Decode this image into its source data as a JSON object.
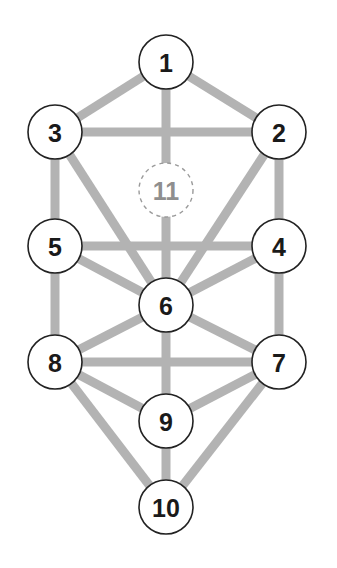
{
  "diagram": {
    "title": "",
    "edge_color": "#b3b3b3",
    "node_stroke": "#222222",
    "hidden_node_stroke": "#9a9a9a",
    "nodes": [
      {
        "id": "1",
        "label": "1",
        "x": 166,
        "y": 62,
        "r": 27,
        "style": "solid"
      },
      {
        "id": "2",
        "label": "2",
        "x": 279,
        "y": 132,
        "r": 27,
        "style": "solid"
      },
      {
        "id": "3",
        "label": "3",
        "x": 55,
        "y": 132,
        "r": 27,
        "style": "solid"
      },
      {
        "id": "11",
        "label": "11",
        "x": 166,
        "y": 190,
        "r": 27,
        "style": "dashed"
      },
      {
        "id": "4",
        "label": "4",
        "x": 279,
        "y": 246,
        "r": 27,
        "style": "solid"
      },
      {
        "id": "5",
        "label": "5",
        "x": 55,
        "y": 246,
        "r": 27,
        "style": "solid"
      },
      {
        "id": "6",
        "label": "6",
        "x": 166,
        "y": 305,
        "r": 27,
        "style": "solid"
      },
      {
        "id": "7",
        "label": "7",
        "x": 279,
        "y": 362,
        "r": 27,
        "style": "solid"
      },
      {
        "id": "8",
        "label": "8",
        "x": 55,
        "y": 362,
        "r": 27,
        "style": "solid"
      },
      {
        "id": "9",
        "label": "9",
        "x": 166,
        "y": 421,
        "r": 27,
        "style": "solid"
      },
      {
        "id": "10",
        "label": "10",
        "x": 166,
        "y": 507,
        "r": 27,
        "style": "solid"
      }
    ],
    "edges": [
      [
        "1",
        "2"
      ],
      [
        "1",
        "3"
      ],
      [
        "1",
        "6"
      ],
      [
        "2",
        "3"
      ],
      [
        "2",
        "4"
      ],
      [
        "2",
        "6"
      ],
      [
        "3",
        "5"
      ],
      [
        "3",
        "6"
      ],
      [
        "4",
        "5"
      ],
      [
        "4",
        "6"
      ],
      [
        "4",
        "7"
      ],
      [
        "5",
        "6"
      ],
      [
        "5",
        "8"
      ],
      [
        "6",
        "7"
      ],
      [
        "6",
        "8"
      ],
      [
        "6",
        "9"
      ],
      [
        "7",
        "8"
      ],
      [
        "7",
        "9"
      ],
      [
        "7",
        "10"
      ],
      [
        "8",
        "9"
      ],
      [
        "8",
        "10"
      ],
      [
        "9",
        "10"
      ]
    ]
  }
}
